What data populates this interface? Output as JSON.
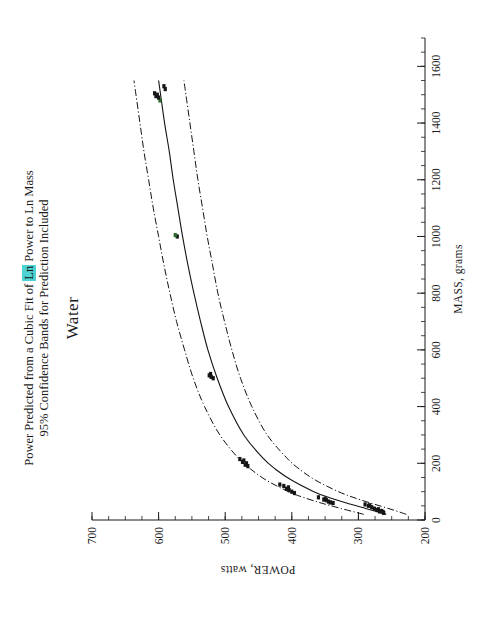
{
  "figure": {
    "title_line_1_part_a": "Power Predicted from a Cubic Fit of ",
    "title_line_1_highlight": "Ln",
    "title_line_1_part_b": " Power to Ln Mass",
    "title_line_2": "95% Confidence Bands for Prediction Included",
    "subtitle": "Water",
    "highlight_color": "#4fd2d2",
    "line_color": "#141414",
    "point_color": "#151515",
    "point_color_alt": "#2d6b2d"
  },
  "chart_data": {
    "type": "scatter",
    "title": "Power Predicted from a Cubic Fit of Ln Power to Ln Mass",
    "subtitle2": "95% Confidence Bands for Prediction Included",
    "subtitle": "Water",
    "xlabel": "MASS, grams",
    "ylabel": "POWER, watts",
    "xlim": [
      0,
      1700
    ],
    "ylim": [
      200,
      700
    ],
    "xticks": [
      0,
      200,
      400,
      600,
      800,
      1000,
      1200,
      1400,
      1600
    ],
    "xtick_labels": [
      "0",
      "200",
      "400",
      "600",
      "800",
      "1000",
      "1200",
      "1400",
      "1600"
    ],
    "yticks": [
      200,
      300,
      400,
      500,
      600,
      700
    ],
    "ytick_labels": [
      "200",
      "300",
      "400",
      "500",
      "600",
      "700"
    ],
    "minor_tick_interval_x": 50,
    "minor_tick_interval_y": 25,
    "grid": false,
    "legend": false,
    "series": [
      {
        "name": "Observed power",
        "type": "scatter",
        "marker": "square",
        "points": [
          [
            25,
            262
          ],
          [
            28,
            263
          ],
          [
            30,
            268
          ],
          [
            32,
            265
          ],
          [
            35,
            272
          ],
          [
            38,
            270
          ],
          [
            40,
            276
          ],
          [
            45,
            280
          ],
          [
            50,
            285
          ],
          [
            52,
            283
          ],
          [
            55,
            290
          ],
          [
            60,
            338
          ],
          [
            62,
            342
          ],
          [
            65,
            345
          ],
          [
            70,
            348
          ],
          [
            72,
            352
          ],
          [
            75,
            350
          ],
          [
            80,
            360
          ],
          [
            95,
            396
          ],
          [
            100,
            400
          ],
          [
            105,
            404
          ],
          [
            110,
            408
          ],
          [
            115,
            405
          ],
          [
            120,
            412
          ],
          [
            125,
            418
          ],
          [
            190,
            466
          ],
          [
            195,
            470
          ],
          [
            200,
            468
          ],
          [
            205,
            474
          ],
          [
            210,
            472
          ],
          [
            215,
            478
          ],
          [
            500,
            518
          ],
          [
            505,
            521
          ],
          [
            510,
            524
          ],
          [
            515,
            522
          ],
          [
            1000,
            572
          ],
          [
            1005,
            575
          ],
          [
            1480,
            598
          ],
          [
            1490,
            600
          ],
          [
            1495,
            604
          ],
          [
            1500,
            602
          ],
          [
            1505,
            606
          ],
          [
            1520,
            590
          ],
          [
            1530,
            592
          ]
        ]
      },
      {
        "name": "Cubic fit (predicted power)",
        "type": "line",
        "style": "solid",
        "points": [
          [
            20,
            258
          ],
          [
            40,
            288
          ],
          [
            60,
            318
          ],
          [
            80,
            345
          ],
          [
            100,
            367
          ],
          [
            140,
            400
          ],
          [
            180,
            425
          ],
          [
            220,
            444
          ],
          [
            300,
            472
          ],
          [
            400,
            495
          ],
          [
            500,
            512
          ],
          [
            600,
            526
          ],
          [
            700,
            537
          ],
          [
            800,
            547
          ],
          [
            900,
            556
          ],
          [
            1000,
            564
          ],
          [
            1100,
            571
          ],
          [
            1200,
            578
          ],
          [
            1300,
            584
          ],
          [
            1400,
            591
          ],
          [
            1500,
            597
          ],
          [
            1550,
            600
          ]
        ]
      },
      {
        "name": "95% upper prediction band",
        "type": "line",
        "style": "dash-dot",
        "points": [
          [
            20,
            292
          ],
          [
            40,
            325
          ],
          [
            60,
            356
          ],
          [
            80,
            383
          ],
          [
            100,
            405
          ],
          [
            140,
            438
          ],
          [
            180,
            462
          ],
          [
            220,
            481
          ],
          [
            300,
            508
          ],
          [
            400,
            531
          ],
          [
            500,
            548
          ],
          [
            600,
            561
          ],
          [
            700,
            573
          ],
          [
            800,
            583
          ],
          [
            900,
            592
          ],
          [
            1000,
            600
          ],
          [
            1100,
            608
          ],
          [
            1200,
            615
          ],
          [
            1300,
            622
          ],
          [
            1400,
            628
          ],
          [
            1500,
            634
          ],
          [
            1550,
            637
          ]
        ]
      },
      {
        "name": "95% lower prediction band",
        "type": "line",
        "style": "dash-dot",
        "points": [
          [
            20,
            228
          ],
          [
            40,
            254
          ],
          [
            60,
            282
          ],
          [
            80,
            308
          ],
          [
            100,
            330
          ],
          [
            140,
            364
          ],
          [
            180,
            389
          ],
          [
            220,
            408
          ],
          [
            300,
            437
          ],
          [
            400,
            460
          ],
          [
            500,
            477
          ],
          [
            600,
            490
          ],
          [
            700,
            501
          ],
          [
            800,
            511
          ],
          [
            900,
            519
          ],
          [
            1000,
            527
          ],
          [
            1100,
            534
          ],
          [
            1200,
            541
          ],
          [
            1300,
            547
          ],
          [
            1400,
            553
          ],
          [
            1500,
            559
          ],
          [
            1550,
            562
          ]
        ]
      }
    ]
  }
}
